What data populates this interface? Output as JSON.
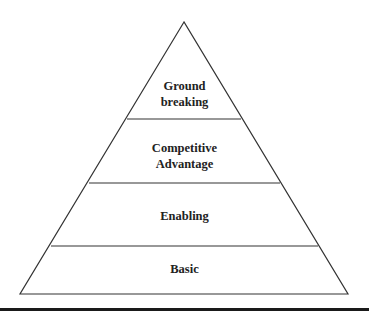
{
  "diagram": {
    "type": "pyramid",
    "levels_top_to_bottom": [
      {
        "lines": [
          "Ground",
          "breaking"
        ]
      },
      {
        "lines": [
          "Competitive",
          "Advantage"
        ]
      },
      {
        "lines": [
          "Enabling"
        ]
      },
      {
        "lines": [
          "Basic"
        ]
      }
    ],
    "line_color": "#333333",
    "text_color": "#222222",
    "rule_color": "#1a1a1a"
  }
}
